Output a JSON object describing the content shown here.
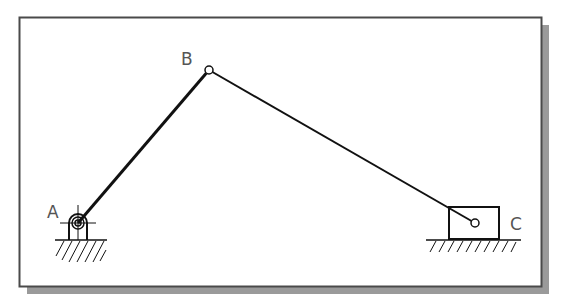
{
  "diagram": {
    "type": "slider-crank mechanism",
    "labels": {
      "A": "A",
      "B": "B",
      "C": "C"
    },
    "joints": {
      "A": {
        "x": 78,
        "y": 223,
        "kind": "fixed pivot (ground bearing)"
      },
      "B": {
        "x": 209,
        "y": 70,
        "kind": "revolute pin"
      },
      "C": {
        "x": 475,
        "y": 223,
        "kind": "slider pin"
      }
    },
    "links": [
      {
        "from": "A",
        "to": "B",
        "name": "crank AB"
      },
      {
        "from": "B",
        "to": "C",
        "name": "connecting rod BC"
      }
    ],
    "colors": {
      "line": "#111111",
      "frame": "#555555",
      "shadow": "#9a9a9a",
      "label": "#555555",
      "background": "#ffffff"
    }
  }
}
